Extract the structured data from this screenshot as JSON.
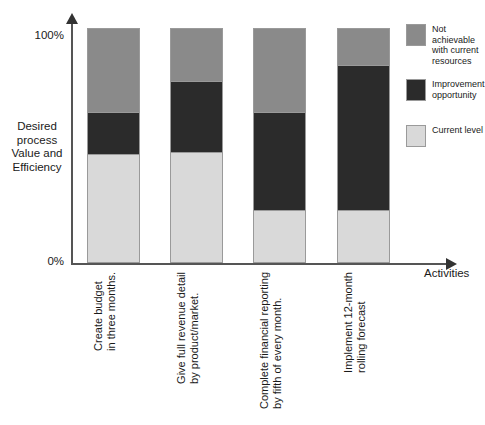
{
  "chart_data": {
    "type": "bar",
    "subtype": "stacked-bar-100-percent",
    "title": "",
    "xlabel": "Activities",
    "ylabel": "Desired process Value and Efficiency",
    "ylim": [
      0,
      100
    ],
    "ytick_labels": [
      "0%",
      "100%"
    ],
    "yticks": [
      0,
      100
    ],
    "grid": false,
    "legend_position": "right",
    "categories": [
      "Create budget in three months.",
      "Give full revenue detail by product/market.",
      "Complete financial reporting by fifth of every month.",
      "Implement 12-month rolling forecast"
    ],
    "category_lines": [
      [
        "Create budget",
        "in three months."
      ],
      [
        "Give full revenue detail",
        "by product/market."
      ],
      [
        "Complete financial reporting",
        "by fifth of every month."
      ],
      [
        "Implement 12-month",
        "rolling forecast"
      ]
    ],
    "series": [
      {
        "name": "Current level",
        "color": "#d9d9d9",
        "values": [
          46,
          47,
          22,
          22
        ]
      },
      {
        "name": "Improvement opportunity",
        "color": "#2b2b2b",
        "values": [
          18,
          30,
          42,
          62
        ]
      },
      {
        "name": "Not achievable with current resources",
        "color": "#8a8a8a",
        "values": [
          36,
          23,
          36,
          16
        ]
      }
    ]
  },
  "axes": {
    "y_title_lines": [
      "Desired",
      "process",
      "Value and",
      "Efficiency"
    ],
    "y_tick_top": "100%",
    "y_tick_bottom": "0%",
    "x_title": "Activities"
  },
  "legend": {
    "items": [
      {
        "label_lines": [
          "Not achievable",
          "with current",
          "resources"
        ],
        "label": "Not achievable with current resources",
        "color": "#8a8a8a"
      },
      {
        "label_lines": [
          "Improvement",
          "opportunity"
        ],
        "label": "Improvement opportunity",
        "color": "#2b2b2b"
      },
      {
        "label_lines": [
          "Current level"
        ],
        "label": "Current level",
        "color": "#d9d9d9"
      }
    ]
  },
  "colors": {
    "not_achievable": "#8a8a8a",
    "improvement": "#2b2b2b",
    "current_level": "#d9d9d9",
    "axis": "#555555",
    "text": "#1a1a1a",
    "background": "#ffffff"
  }
}
